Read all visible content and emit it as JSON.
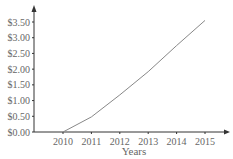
{
  "chart_data": {
    "type": "line",
    "title": "",
    "xlabel": "Years",
    "ylabel": "",
    "categories": [
      "2010",
      "2011",
      "2012",
      "2013",
      "2014",
      "2015"
    ],
    "x": [
      2010,
      2011,
      2012,
      2013,
      2014,
      2015
    ],
    "series": [
      {
        "name": "Price",
        "values": [
          0.0,
          0.48,
          1.18,
          1.92,
          2.75,
          3.55
        ]
      }
    ],
    "y_ticks": [
      "$0.00",
      "$0.50",
      "$1.00",
      "$1.50",
      "$2.00",
      "$2.50",
      "$3.00",
      "$3.50"
    ],
    "y_tick_values": [
      0,
      0.5,
      1.0,
      1.5,
      2.0,
      2.5,
      3.0,
      3.5
    ],
    "ylim": [
      0,
      3.5
    ],
    "grid": false,
    "legend": "none",
    "colors": {
      "line": "#888888",
      "axis": "#333333",
      "text": "#666666"
    }
  }
}
